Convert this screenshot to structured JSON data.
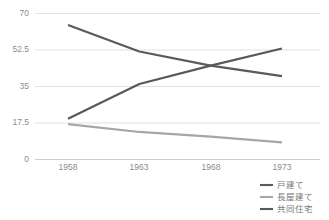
{
  "chart_data": {
    "type": "line",
    "title": "",
    "xlabel": "",
    "ylabel": "",
    "x": [
      "1958",
      "1963",
      "1968",
      "1973"
    ],
    "categories": [
      "1958",
      "1963",
      "1968",
      "1973"
    ],
    "ylim": [
      0,
      70
    ],
    "yticks": [
      "0",
      "17.5",
      "35",
      "52.5",
      "70"
    ],
    "ytick_values": [
      0,
      17.5,
      35,
      52.5,
      70
    ],
    "grid": "horizontal",
    "legend_position": "bottom-right",
    "series": [
      {
        "name": "戸建て",
        "color": "#5a5a5a",
        "values": [
          64.5,
          51.8,
          45.0,
          40.0
        ]
      },
      {
        "name": "長屋建て",
        "color": "#a6a6a6",
        "values": [
          17.0,
          13.2,
          11.0,
          8.2
        ]
      },
      {
        "name": "共同住宅",
        "color": "#595959",
        "values": [
          19.5,
          36.2,
          45.0,
          53.2
        ]
      }
    ]
  },
  "axis": {
    "y_labels": [
      "70",
      "52.5",
      "35",
      "17.5",
      "0"
    ],
    "x_labels": [
      "1958",
      "1963",
      "1968",
      "1973"
    ]
  },
  "legend": {
    "items": [
      {
        "label": "戸建て",
        "color": "#5a5a5a"
      },
      {
        "label": "長屋建て",
        "color": "#a6a6a6"
      },
      {
        "label": "共同住宅",
        "color": "#595959"
      }
    ]
  },
  "colors": {
    "grid": "#d9d9d9",
    "axis": "#bfbfbf",
    "tick_text": "#8c8c8c",
    "legend_text": "#777777",
    "background": "#ffffff"
  }
}
